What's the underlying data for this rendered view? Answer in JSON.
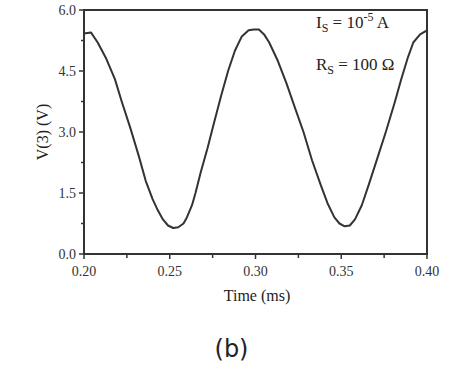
{
  "chart_data": {
    "type": "line",
    "title": "",
    "xlabel": "Time (ms)",
    "ylabel": "V(3) (V)",
    "xlim": [
      0.2,
      0.4
    ],
    "ylim": [
      0.0,
      6.0
    ],
    "xticks": [
      "0.20",
      "0.25",
      "0.30",
      "0.35",
      "0.40"
    ],
    "yticks": [
      "0.0",
      "1.5",
      "3.0",
      "4.5",
      "6.0"
    ],
    "grid": false,
    "legend": null,
    "annotations": [
      {
        "text": "I_S = 10^-5 A",
        "main": "I",
        "sub": "S",
        "mid": " = 10",
        "sup": "-5",
        "tail": "  A"
      },
      {
        "text": "R_S = 100 Ω",
        "main": "R",
        "sub": "S",
        "mid": " = 100 Ω",
        "sup": "",
        "tail": ""
      }
    ],
    "series": [
      {
        "name": "V(3)",
        "x": [
          0.2,
          0.204,
          0.208,
          0.213,
          0.218,
          0.222,
          0.227,
          0.232,
          0.236,
          0.24,
          0.243,
          0.246,
          0.249,
          0.252,
          0.255,
          0.258,
          0.26,
          0.263,
          0.265,
          0.268,
          0.272,
          0.276,
          0.28,
          0.284,
          0.288,
          0.292,
          0.296,
          0.299,
          0.302,
          0.305,
          0.308,
          0.313,
          0.318,
          0.323,
          0.328,
          0.333,
          0.338,
          0.342,
          0.346,
          0.349,
          0.352,
          0.355,
          0.358,
          0.362,
          0.366,
          0.371,
          0.376,
          0.381,
          0.385,
          0.389,
          0.392,
          0.396,
          0.4
        ],
        "values": [
          5.42,
          5.45,
          5.2,
          4.8,
          4.3,
          3.75,
          3.1,
          2.4,
          1.8,
          1.35,
          1.08,
          0.85,
          0.7,
          0.64,
          0.66,
          0.75,
          0.9,
          1.2,
          1.5,
          2.0,
          2.6,
          3.25,
          3.9,
          4.5,
          5.0,
          5.35,
          5.5,
          5.52,
          5.52,
          5.4,
          5.2,
          4.75,
          4.2,
          3.6,
          3.0,
          2.3,
          1.7,
          1.25,
          0.9,
          0.75,
          0.68,
          0.7,
          0.85,
          1.2,
          1.7,
          2.35,
          3.0,
          3.7,
          4.3,
          4.85,
          5.2,
          5.4,
          5.5
        ]
      }
    ]
  },
  "caption": "(b)"
}
